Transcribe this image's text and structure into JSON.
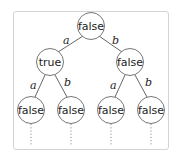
{
  "diagram": {
    "type": "binary-tree",
    "nodes": [
      {
        "id": "root",
        "label": "false",
        "cx": 91,
        "cy": 26
      },
      {
        "id": "a",
        "label": "true",
        "cx": 50,
        "cy": 62
      },
      {
        "id": "b",
        "label": "false",
        "cx": 130,
        "cy": 62
      },
      {
        "id": "aa",
        "label": "false",
        "cx": 31,
        "cy": 110
      },
      {
        "id": "ab",
        "label": "false",
        "cx": 71,
        "cy": 110
      },
      {
        "id": "ba",
        "label": "false",
        "cx": 111,
        "cy": 110
      },
      {
        "id": "bb",
        "label": "false",
        "cx": 151,
        "cy": 110
      }
    ],
    "edges": [
      {
        "from": "root",
        "to": "a",
        "label": "a"
      },
      {
        "from": "root",
        "to": "b",
        "label": "b"
      },
      {
        "from": "a",
        "to": "aa",
        "label": "a"
      },
      {
        "from": "a",
        "to": "ab",
        "label": "b"
      },
      {
        "from": "b",
        "to": "ba",
        "label": "a"
      },
      {
        "from": "b",
        "to": "bb",
        "label": "b"
      }
    ],
    "continuation": "dotted"
  },
  "colors": {
    "stroke": "#555555",
    "node_fill": "#ffffff",
    "frame_border": "#d4d4d4"
  }
}
